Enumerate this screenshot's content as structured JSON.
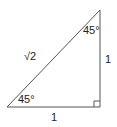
{
  "diagram": {
    "type": "right-triangle",
    "shape": "45-45-90 triangle",
    "stroke_color": "#555555",
    "labels": {
      "hypotenuse": "√2",
      "vertical_leg": "1",
      "horizontal_leg": "1",
      "top_angle": "45°",
      "bottom_left_angle": "45°"
    },
    "right_angle_marker": true
  }
}
